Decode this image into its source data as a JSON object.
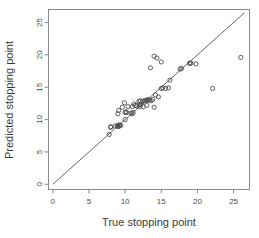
{
  "chart_data": {
    "type": "scatter",
    "title": "",
    "xlabel": "True stopping point",
    "ylabel": "Predicted stopping point",
    "xlim": [
      -0.6,
      27.2
    ],
    "ylim": [
      -0.8,
      27.0
    ],
    "xticks": [
      0,
      5,
      10,
      15,
      20,
      25
    ],
    "yticks": [
      0,
      5,
      10,
      15,
      20,
      25
    ],
    "xticklabels": [
      "0",
      "5",
      "10",
      "15",
      "20",
      "25"
    ],
    "yticklabels": [
      "0",
      "5",
      "10",
      "15",
      "20",
      "25"
    ],
    "grid": false,
    "legend": null,
    "marker": "open-circle",
    "marker_color": "#4d4d4d",
    "reference_line": {
      "type": "identity",
      "label": "y = x",
      "from": [
        0,
        0
      ],
      "to": [
        26.5,
        26.5
      ],
      "color": "#555555"
    },
    "x": [
      7.8,
      8.0,
      8.0,
      8.6,
      8.9,
      9.0,
      9.0,
      9.0,
      9.1,
      9.2,
      9.2,
      9.4,
      9.6,
      9.9,
      10.0,
      10.0,
      10.1,
      10.2,
      10.4,
      10.8,
      11.0,
      11.0,
      11.1,
      11.2,
      11.4,
      11.6,
      11.9,
      12.0,
      12.0,
      12.1,
      12.2,
      12.4,
      12.5,
      12.6,
      12.8,
      13.0,
      13.0,
      13.1,
      13.2,
      13.4,
      13.5,
      13.6,
      13.8,
      14.0,
      14.0,
      14.2,
      14.4,
      14.6,
      15.0,
      15.0,
      15.2,
      15.6,
      16.0,
      16.2,
      17.6,
      17.8,
      18.9,
      19.0,
      19.1,
      19.8,
      22.1,
      26.0
    ],
    "y": [
      7.7,
      8.9,
      8.8,
      9.0,
      9.0,
      8.9,
      9.1,
      10.9,
      11.4,
      9.2,
      9.0,
      9.1,
      11.9,
      12.6,
      10.0,
      11.1,
      11.2,
      11.1,
      12.0,
      11.0,
      10.9,
      12.0,
      11.1,
      12.4,
      12.2,
      12.1,
      12.8,
      12.0,
      12.3,
      12.9,
      12.3,
      12.8,
      12.0,
      12.9,
      12.9,
      12.2,
      13.0,
      13.0,
      13.1,
      13.0,
      18.0,
      12.9,
      13.1,
      11.9,
      19.8,
      13.8,
      19.5,
      13.5,
      14.8,
      18.9,
      14.9,
      14.8,
      14.9,
      16.1,
      17.8,
      17.9,
      18.7,
      18.7,
      18.7,
      18.6,
      14.8,
      19.6
    ]
  }
}
